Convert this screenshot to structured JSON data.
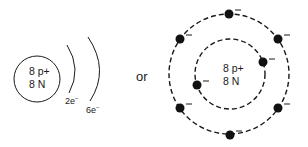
{
  "left_model": {
    "nucleus": {
      "protons": "8 p+",
      "neutrons": "8 N"
    },
    "shells": [
      {
        "label": "2e",
        "superscript": "−"
      },
      {
        "label": "6e",
        "superscript": "−"
      }
    ]
  },
  "connector": {
    "text": "or"
  },
  "right_model": {
    "nucleus": {
      "protons": "8 p+",
      "neutrons": "8 N"
    },
    "inner_shell_electrons": 2,
    "outer_shell_electrons": 6,
    "electron_charge": "−"
  },
  "colors": {
    "ink": "#1a1a1a",
    "background": "#ffffff"
  }
}
